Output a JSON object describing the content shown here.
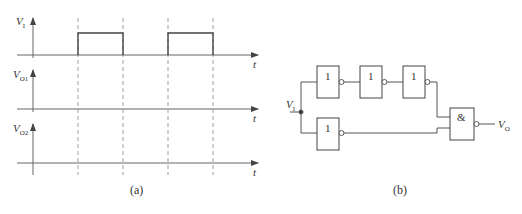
{
  "figure_a": {
    "caption": "(a)",
    "axes": [
      {
        "label": "V",
        "sub": "I",
        "t_label": "t"
      },
      {
        "label": "V",
        "sub": "O1",
        "t_label": "t"
      },
      {
        "label": "V",
        "sub": "O2",
        "t_label": "t"
      }
    ],
    "pulses_x": [
      [
        78,
        123
      ],
      [
        168,
        213
      ]
    ],
    "dashed_x": [
      78,
      123,
      168,
      213
    ]
  },
  "figure_b": {
    "caption": "(b)",
    "input_label": "V",
    "input_sub": "I",
    "output_label": "V",
    "output_sub": "O",
    "inverter_symbol": "1",
    "and_symbol": "&",
    "inverter_count_top": 3,
    "inverter_count_bottom": 1
  },
  "colors": {
    "line": "#555555",
    "text": "#333333"
  }
}
